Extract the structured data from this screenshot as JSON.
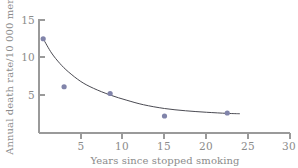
{
  "chart_data": {
    "type": "scatter",
    "title": "",
    "xlabel": "Years since stopped smoking",
    "ylabel": "Annual death rate/10 000 men",
    "xlim": [
      0,
      30
    ],
    "ylim": [
      0,
      16
    ],
    "xticks": [
      5,
      10,
      15,
      20,
      25,
      30
    ],
    "yticks": [
      5,
      10,
      15
    ],
    "xticklabels": [
      "5",
      "10",
      "15",
      "20",
      "25",
      "30"
    ],
    "yticklabels": [
      "5",
      "10",
      "15"
    ],
    "grid": false,
    "legend": null,
    "series": [
      {
        "name": "Observed death rate",
        "marker": "filled-circle",
        "color": "#8184aa",
        "points": [
          {
            "x": 0.5,
            "y": 12.5
          },
          {
            "x": 3.0,
            "y": 6.1
          },
          {
            "x": 8.5,
            "y": 5.2
          },
          {
            "x": 15.0,
            "y": 2.2
          },
          {
            "x": 22.5,
            "y": 2.6
          }
        ]
      },
      {
        "name": "Fitted decay curve",
        "marker": "none",
        "color": "#4a4a52",
        "points": [
          {
            "x": 0.5,
            "y": 12.5
          },
          {
            "x": 1.5,
            "y": 10.6
          },
          {
            "x": 2.5,
            "y": 9.2
          },
          {
            "x": 3.5,
            "y": 8.1
          },
          {
            "x": 5.0,
            "y": 6.8
          },
          {
            "x": 6.5,
            "y": 5.9
          },
          {
            "x": 8.5,
            "y": 5.0
          },
          {
            "x": 10.5,
            "y": 4.3
          },
          {
            "x": 12.5,
            "y": 3.7
          },
          {
            "x": 15.0,
            "y": 3.2
          },
          {
            "x": 17.5,
            "y": 2.9
          },
          {
            "x": 20.0,
            "y": 2.7
          },
          {
            "x": 22.5,
            "y": 2.55
          },
          {
            "x": 24.0,
            "y": 2.5
          }
        ]
      }
    ]
  },
  "axes": {
    "y_tick_0": "5",
    "y_tick_1": "10",
    "y_tick_2": "15",
    "x_tick_0": "5",
    "x_tick_1": "10",
    "x_tick_2": "15",
    "x_tick_3": "20",
    "x_tick_4": "25",
    "x_tick_5": "30",
    "x_title": "Years since stopped smoking",
    "y_title": "Annual death rate/10 000 men"
  },
  "colors": {
    "marker": "#8184aa",
    "curve": "#4a4a52",
    "axis": "#9a9a9a",
    "text": "#8b8b8b",
    "background": "#ffffff"
  }
}
